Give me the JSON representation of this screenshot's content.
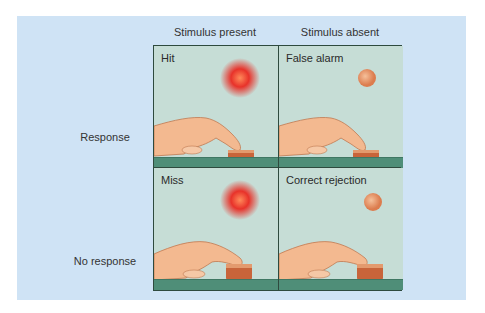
{
  "columns": [
    "Stimulus present",
    "Stimulus absent"
  ],
  "rows": [
    "Response",
    "No response"
  ],
  "cells": [
    {
      "label": "Hit",
      "stimulus": "bright-red-glow",
      "response": "pressing-button"
    },
    {
      "label": "False alarm",
      "stimulus": "faint-orange-dot",
      "response": "pressing-button"
    },
    {
      "label": "Miss",
      "stimulus": "bright-red-glow",
      "response": "not-pressing"
    },
    {
      "label": "Correct rejection",
      "stimulus": "faint-orange-dot",
      "response": "not-pressing"
    }
  ],
  "colors": {
    "panel": "#cfe3f5",
    "cell": "#c6ddd6",
    "floor": "#4f8e78",
    "stimulus_strong": "#e8322a",
    "stimulus_weak": "#e89a6a",
    "button": "#c8643a",
    "hand": "#f3b990"
  }
}
